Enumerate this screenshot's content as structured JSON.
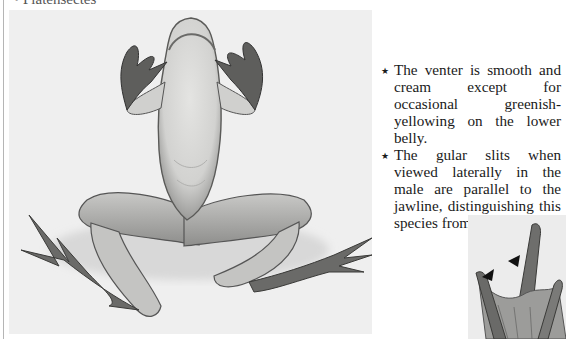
{
  "page": {
    "cut_heading": "• Platensectes",
    "figures": {
      "main_photo": {
        "subject": "frog-ventral-view",
        "tone": "grayscale",
        "background_color": "#efefef"
      },
      "inset_photo": {
        "subject": "frog-throat-gular-slits-closeup",
        "annotations": [
          "arrowhead",
          "arrowhead"
        ]
      }
    },
    "notes": [
      {
        "bullet_icon": "★",
        "text": "The venter is smooth and cream except for occasional greenish-yellowing on the lower belly."
      },
      {
        "bullet_icon": "★",
        "text": "The gular slits when viewed laterally in the male are parallel to the jawline, distinguishing this species from the others."
      }
    ]
  }
}
